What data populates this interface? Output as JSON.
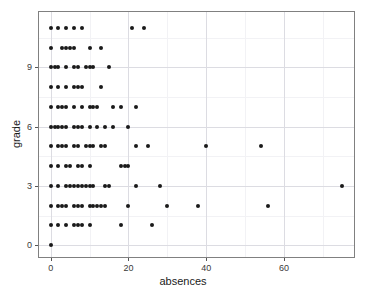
{
  "chart_data": {
    "type": "scatter",
    "title": "",
    "xlabel": "absences",
    "ylabel": "grade",
    "xlim": [
      -3,
      78
    ],
    "ylim": [
      -0.6,
      11.8
    ],
    "grid": true,
    "legend": "none",
    "x_ticks": [
      0,
      20,
      40,
      60
    ],
    "y_ticks": [
      0,
      3,
      6,
      9
    ],
    "x_tick_labels": [
      "0",
      "20",
      "40",
      "60"
    ],
    "y_tick_labels": [
      "0",
      "3",
      "6",
      "9"
    ],
    "x_minor_ticks": [
      10,
      30,
      50,
      70
    ],
    "y_minor_ticks": [
      1.5,
      4.5,
      7.5,
      10.5
    ],
    "point_color": "#1a1a1a",
    "panel_border_color": "#808080",
    "grid_color": "#dcdce2",
    "minor_grid_color": "#f2f2f5",
    "background": "#ffffff",
    "points": [
      {
        "x": 0,
        "y": 11
      },
      {
        "x": 2,
        "y": 11
      },
      {
        "x": 4,
        "y": 11
      },
      {
        "x": 6,
        "y": 11
      },
      {
        "x": 8,
        "y": 11
      },
      {
        "x": 21,
        "y": 11
      },
      {
        "x": 24,
        "y": 11
      },
      {
        "x": 0,
        "y": 10
      },
      {
        "x": 3,
        "y": 10
      },
      {
        "x": 4,
        "y": 10
      },
      {
        "x": 5,
        "y": 10
      },
      {
        "x": 6,
        "y": 10
      },
      {
        "x": 10,
        "y": 10
      },
      {
        "x": 13,
        "y": 10
      },
      {
        "x": 0,
        "y": 9
      },
      {
        "x": 1,
        "y": 9
      },
      {
        "x": 2,
        "y": 9
      },
      {
        "x": 4,
        "y": 9
      },
      {
        "x": 6,
        "y": 9
      },
      {
        "x": 7,
        "y": 9
      },
      {
        "x": 9,
        "y": 9
      },
      {
        "x": 10,
        "y": 9
      },
      {
        "x": 11,
        "y": 9
      },
      {
        "x": 15,
        "y": 9
      },
      {
        "x": 0,
        "y": 8
      },
      {
        "x": 2,
        "y": 8
      },
      {
        "x": 4,
        "y": 8
      },
      {
        "x": 6,
        "y": 8
      },
      {
        "x": 7,
        "y": 8
      },
      {
        "x": 8,
        "y": 8
      },
      {
        "x": 13,
        "y": 8
      },
      {
        "x": 0,
        "y": 7
      },
      {
        "x": 2,
        "y": 7
      },
      {
        "x": 3,
        "y": 7
      },
      {
        "x": 4,
        "y": 7
      },
      {
        "x": 6,
        "y": 7
      },
      {
        "x": 8,
        "y": 7
      },
      {
        "x": 10,
        "y": 7
      },
      {
        "x": 11,
        "y": 7
      },
      {
        "x": 12,
        "y": 7
      },
      {
        "x": 16,
        "y": 7
      },
      {
        "x": 18,
        "y": 7
      },
      {
        "x": 22,
        "y": 7
      },
      {
        "x": 0,
        "y": 6
      },
      {
        "x": 1,
        "y": 6
      },
      {
        "x": 2,
        "y": 6
      },
      {
        "x": 3,
        "y": 6
      },
      {
        "x": 4,
        "y": 6
      },
      {
        "x": 6,
        "y": 6
      },
      {
        "x": 7,
        "y": 6
      },
      {
        "x": 8,
        "y": 6
      },
      {
        "x": 10,
        "y": 6
      },
      {
        "x": 12,
        "y": 6
      },
      {
        "x": 14,
        "y": 6
      },
      {
        "x": 16,
        "y": 6
      },
      {
        "x": 20,
        "y": 6
      },
      {
        "x": 0,
        "y": 5
      },
      {
        "x": 2,
        "y": 5
      },
      {
        "x": 3,
        "y": 5
      },
      {
        "x": 4,
        "y": 5
      },
      {
        "x": 6,
        "y": 5
      },
      {
        "x": 7,
        "y": 5
      },
      {
        "x": 9,
        "y": 5
      },
      {
        "x": 10,
        "y": 5
      },
      {
        "x": 11,
        "y": 5
      },
      {
        "x": 13,
        "y": 5
      },
      {
        "x": 14,
        "y": 5
      },
      {
        "x": 22,
        "y": 5
      },
      {
        "x": 25,
        "y": 5
      },
      {
        "x": 40,
        "y": 5
      },
      {
        "x": 54,
        "y": 5
      },
      {
        "x": 0,
        "y": 4
      },
      {
        "x": 2,
        "y": 4
      },
      {
        "x": 4,
        "y": 4
      },
      {
        "x": 5,
        "y": 4
      },
      {
        "x": 7,
        "y": 4
      },
      {
        "x": 8,
        "y": 4
      },
      {
        "x": 10,
        "y": 4
      },
      {
        "x": 18,
        "y": 4
      },
      {
        "x": 19,
        "y": 4
      },
      {
        "x": 20,
        "y": 4
      },
      {
        "x": 0,
        "y": 3
      },
      {
        "x": 2,
        "y": 3
      },
      {
        "x": 4,
        "y": 3
      },
      {
        "x": 5,
        "y": 3
      },
      {
        "x": 6,
        "y": 3
      },
      {
        "x": 7,
        "y": 3
      },
      {
        "x": 8,
        "y": 3
      },
      {
        "x": 9,
        "y": 3
      },
      {
        "x": 10,
        "y": 3
      },
      {
        "x": 11,
        "y": 3
      },
      {
        "x": 14,
        "y": 3
      },
      {
        "x": 15,
        "y": 3
      },
      {
        "x": 22,
        "y": 3
      },
      {
        "x": 28,
        "y": 3
      },
      {
        "x": 75,
        "y": 3
      },
      {
        "x": 0,
        "y": 2
      },
      {
        "x": 2,
        "y": 2
      },
      {
        "x": 3,
        "y": 2
      },
      {
        "x": 4,
        "y": 2
      },
      {
        "x": 6,
        "y": 2
      },
      {
        "x": 7,
        "y": 2
      },
      {
        "x": 8,
        "y": 2
      },
      {
        "x": 10,
        "y": 2
      },
      {
        "x": 11,
        "y": 2
      },
      {
        "x": 12,
        "y": 2
      },
      {
        "x": 13,
        "y": 2
      },
      {
        "x": 14,
        "y": 2
      },
      {
        "x": 20,
        "y": 2
      },
      {
        "x": 30,
        "y": 2
      },
      {
        "x": 38,
        "y": 2
      },
      {
        "x": 56,
        "y": 2
      },
      {
        "x": 0,
        "y": 1
      },
      {
        "x": 2,
        "y": 1
      },
      {
        "x": 4,
        "y": 1
      },
      {
        "x": 6,
        "y": 1
      },
      {
        "x": 7,
        "y": 1
      },
      {
        "x": 8,
        "y": 1
      },
      {
        "x": 10,
        "y": 1
      },
      {
        "x": 18,
        "y": 1
      },
      {
        "x": 26,
        "y": 1
      },
      {
        "x": 0,
        "y": 0
      }
    ]
  }
}
